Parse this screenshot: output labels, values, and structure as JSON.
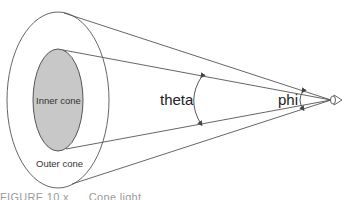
{
  "diagram": {
    "type": "spotlight-cone",
    "labels": {
      "inner_cone": "Inner cone",
      "outer_cone": "Outer cone",
      "theta": "theta",
      "phi": "phi"
    },
    "caption": {
      "figure": "FIGURE 10.x",
      "text": "Cone light"
    },
    "colors": {
      "stroke": "#555555",
      "inner_fill": "#c8c8c8",
      "background": "#ffffff"
    },
    "geometry": {
      "outer_ellipse": {
        "cx": 58,
        "cy": 100,
        "rx": 51,
        "ry": 88
      },
      "inner_ellipse": {
        "cx": 58,
        "cy": 100,
        "rx": 25,
        "ry": 51
      },
      "apex": {
        "x": 331,
        "y": 100
      }
    }
  }
}
